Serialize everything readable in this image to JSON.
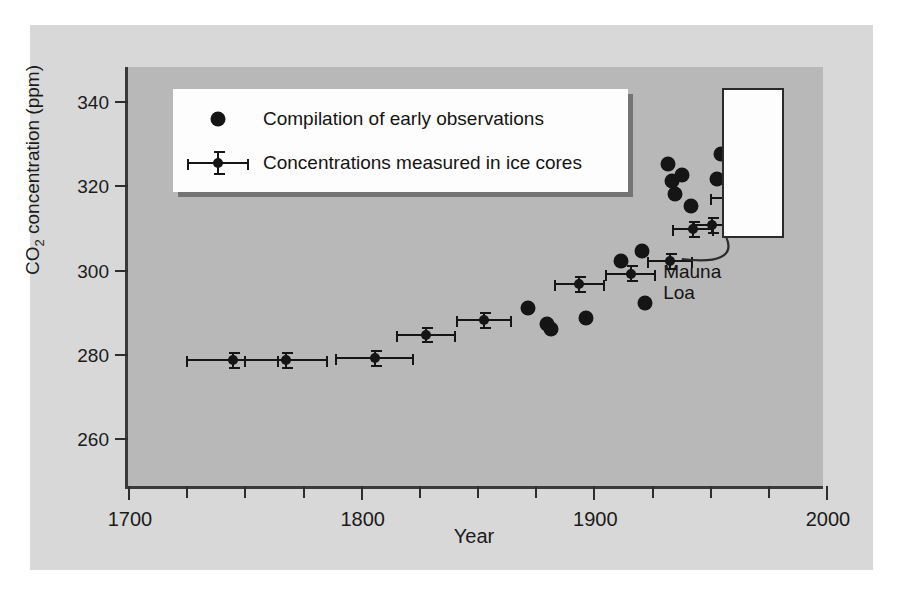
{
  "figure": {
    "background_color": "#d8d8d8",
    "plot_background_color": "#b8b8b8",
    "axis_color": "#2e2e2e",
    "marker_color": "#151515"
  },
  "chart_data": {
    "type": "scatter",
    "title": "",
    "xlabel": "Year",
    "ylabel": "CO2 concentration (ppm)",
    "ylabel_parts": {
      "pre": "CO",
      "sub": "2",
      "post": " concentration (ppm)"
    },
    "xlim": [
      1700,
      2000
    ],
    "ylim": [
      248,
      348
    ],
    "grid": false,
    "x_ticks_major": [
      1700,
      1800,
      1900,
      2000
    ],
    "x_tick_labels": [
      "1700",
      "1800",
      "1900",
      "2000"
    ],
    "x_ticks_minor": [
      1725,
      1750,
      1775,
      1825,
      1850,
      1875,
      1925,
      1950,
      1975
    ],
    "y_ticks": [
      260,
      280,
      300,
      320,
      340
    ],
    "y_tick_labels": [
      "260",
      "280",
      "300",
      "320",
      "340"
    ],
    "legend_position": "upper-left-inside",
    "series": [
      {
        "name": "Compilation of early observations",
        "marker": "large-filled-circle",
        "error_bars": false,
        "points": [
          {
            "x": 1872,
            "y": 291.0
          },
          {
            "x": 1880,
            "y": 287.0
          },
          {
            "x": 1882,
            "y": 286.0
          },
          {
            "x": 1897,
            "y": 288.5
          },
          {
            "x": 1912,
            "y": 302.0
          },
          {
            "x": 1921,
            "y": 304.5
          },
          {
            "x": 1922,
            "y": 292.0
          },
          {
            "x": 1932,
            "y": 325.0
          },
          {
            "x": 1934,
            "y": 321.0
          },
          {
            "x": 1935,
            "y": 318.0
          },
          {
            "x": 1938,
            "y": 322.5
          },
          {
            "x": 1942,
            "y": 315.0
          },
          {
            "x": 1953,
            "y": 321.5
          },
          {
            "x": 1955,
            "y": 327.5
          }
        ]
      },
      {
        "name": "Concentrations measured in ice cores",
        "marker": "small-filled-circle",
        "error_bars": true,
        "points": [
          {
            "x": 1745,
            "y": 278.5,
            "xerr": 20,
            "yerr": 2.0
          },
          {
            "x": 1768,
            "y": 278.5,
            "xerr": 18,
            "yerr": 2.0
          },
          {
            "x": 1806,
            "y": 279.0,
            "xerr": 17,
            "yerr": 2.0
          },
          {
            "x": 1828,
            "y": 284.5,
            "xerr": 13,
            "yerr": 2.0
          },
          {
            "x": 1853,
            "y": 288.0,
            "xerr": 12,
            "yerr": 2.0
          },
          {
            "x": 1894,
            "y": 296.5,
            "xerr": 11,
            "yerr": 2.0
          },
          {
            "x": 1916,
            "y": 299.0,
            "xerr": 11,
            "yerr": 2.0
          },
          {
            "x": 1933,
            "y": 302.0,
            "xerr": 10,
            "yerr": 2.0
          },
          {
            "x": 1943,
            "y": 309.5,
            "xerr": 9,
            "yerr": 2.0
          },
          {
            "x": 1951,
            "y": 310.5,
            "xerr": 8,
            "yerr": 2.0
          },
          {
            "x": 1959,
            "y": 317.0,
            "xerr": 9,
            "yerr": 2.5
          },
          {
            "x": 1970,
            "y": 327.0,
            "xerr": 9,
            "yerr": 2.5
          }
        ]
      }
    ],
    "annotations": [
      {
        "name": "mauna-loa",
        "text": "Mauna\nLoa",
        "line1": "Mauna",
        "line2": "Loa"
      }
    ]
  },
  "legend": {
    "items": [
      {
        "label": "Compilation of early observations",
        "marker": "dot"
      },
      {
        "label": "Concentrations measured in ice cores",
        "marker": "dot-with-error-bars"
      }
    ]
  }
}
